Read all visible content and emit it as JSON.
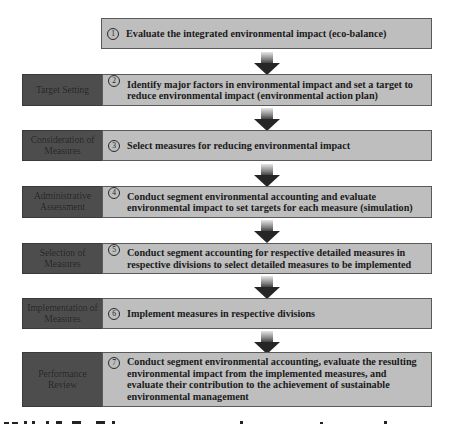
{
  "diagram": {
    "type": "process-flow",
    "direction": "top-to-bottom",
    "colors": {
      "box_fill": "#bebebe",
      "box_border": "#5a5a5a",
      "label_fill": "#4d4d4d",
      "label_text": "#1e1e1e",
      "arrow_dark": "#262626",
      "arrow_light": "#e6e6e6"
    },
    "steps": [
      {
        "number": "1",
        "label": "",
        "text": "Evaluate the integrated environmental impact (eco-balance)"
      },
      {
        "number": "2",
        "label": "Target Setting",
        "text": "Identify major factors in environmental impact and set a target to reduce environmental impact (environmental action plan)"
      },
      {
        "number": "3",
        "label": "Consideration of Measures",
        "text": "Select measures for reducing environmental impact"
      },
      {
        "number": "4",
        "label": "Administrative Assessment",
        "text": "Conduct segment environmental accounting and evaluate environmental impact to set targets for each measure (simulation)"
      },
      {
        "number": "5",
        "label": "Selection of Measures",
        "text": "Conduct segment accounting for respective detailed measures in respective divisions to select detailed measures to be implemented"
      },
      {
        "number": "6",
        "label": "Implementation of Measures",
        "text": "Implement measures in respective divisions"
      },
      {
        "number": "7",
        "label": "Performance Review",
        "text": "Conduct segment environmental accounting, evaluate the resulting environmental impact from the implemented measures, and evaluate their contribution to the achievement of sustainable environmental management"
      }
    ],
    "arrows": [
      {
        "from": "1",
        "to": "2"
      },
      {
        "from": "2",
        "to": "3"
      },
      {
        "from": "3",
        "to": "4"
      },
      {
        "from": "4",
        "to": "5"
      },
      {
        "from": "5",
        "to": "6"
      },
      {
        "from": "6",
        "to": "7"
      }
    ]
  }
}
